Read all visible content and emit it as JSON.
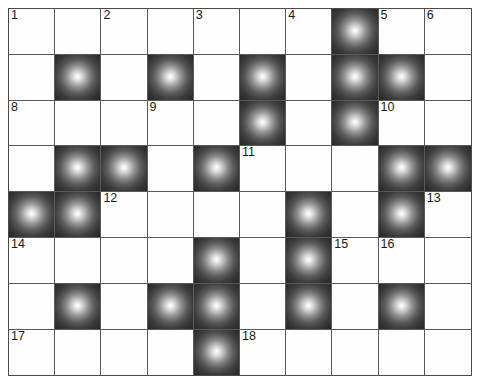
{
  "puzzle": {
    "type": "crossword-grid",
    "columns": 10,
    "rows": 7,
    "cell_size_px": 46,
    "grid_origin_px": [
      8,
      8
    ],
    "colors": {
      "empty_cell": "#fefefe",
      "block_cell_center": "#ffffff",
      "block_cell_edge": "#272727",
      "grid_line": "#5a5a5a",
      "border": "#4a4a4a",
      "number_text": "#1a1a1a"
    },
    "clue_numbers": [
      1,
      2,
      3,
      4,
      5,
      6,
      7,
      8,
      9,
      10,
      11,
      12,
      13,
      14,
      15,
      16,
      17,
      18
    ],
    "cells": [
      [
        {
          "block": false,
          "number": "1"
        },
        {
          "block": false,
          "number": ""
        },
        {
          "block": false,
          "number": "2"
        },
        {
          "block": false,
          "number": ""
        },
        {
          "block": false,
          "number": "3"
        },
        {
          "block": false,
          "number": ""
        },
        {
          "block": false,
          "number": "4"
        },
        {
          "block": true,
          "number": ""
        },
        {
          "block": false,
          "number": "5"
        },
        {
          "block": false,
          "number": "6"
        }
      ],
      [
        {
          "block": false,
          "number": ""
        },
        {
          "block": true,
          "number": ""
        },
        {
          "block": false,
          "number": ""
        },
        {
          "block": true,
          "number": ""
        },
        {
          "block": false,
          "number": ""
        },
        {
          "block": true,
          "number": ""
        },
        {
          "block": false,
          "number": ""
        },
        {
          "block": true,
          "number": ""
        },
        {
          "block": true,
          "number": ""
        },
        {
          "block": false,
          "number": ""
        }
      ],
      [
        {
          "block": false,
          "number": "8"
        },
        {
          "block": false,
          "number": ""
        },
        {
          "block": false,
          "number": ""
        },
        {
          "block": false,
          "number": "9"
        },
        {
          "block": false,
          "number": ""
        },
        {
          "block": true,
          "number": ""
        },
        {
          "block": false,
          "number": ""
        },
        {
          "block": true,
          "number": ""
        },
        {
          "block": false,
          "number": "10"
        },
        {
          "block": false,
          "number": ""
        }
      ],
      [
        {
          "block": false,
          "number": ""
        },
        {
          "block": true,
          "number": ""
        },
        {
          "block": true,
          "number": ""
        },
        {
          "block": false,
          "number": ""
        },
        {
          "block": true,
          "number": ""
        },
        {
          "block": false,
          "number": "11"
        },
        {
          "block": false,
          "number": ""
        },
        {
          "block": false,
          "number": ""
        },
        {
          "block": true,
          "number": ""
        },
        {
          "block": true,
          "number": ""
        }
      ],
      [
        {
          "block": true,
          "number": ""
        },
        {
          "block": true,
          "number": ""
        },
        {
          "block": false,
          "number": "12"
        },
        {
          "block": false,
          "number": ""
        },
        {
          "block": false,
          "number": ""
        },
        {
          "block": false,
          "number": ""
        },
        {
          "block": true,
          "number": ""
        },
        {
          "block": false,
          "number": ""
        },
        {
          "block": true,
          "number": ""
        },
        {
          "block": false,
          "number": "13"
        }
      ],
      [
        {
          "block": false,
          "number": "14"
        },
        {
          "block": false,
          "number": ""
        },
        {
          "block": false,
          "number": ""
        },
        {
          "block": false,
          "number": ""
        },
        {
          "block": true,
          "number": ""
        },
        {
          "block": false,
          "number": ""
        },
        {
          "block": true,
          "number": ""
        },
        {
          "block": false,
          "number": "15"
        },
        {
          "block": false,
          "number": "16"
        },
        {
          "block": false,
          "number": ""
        }
      ],
      [
        {
          "block": false,
          "number": ""
        },
        {
          "block": true,
          "number": ""
        },
        {
          "block": false,
          "number": ""
        },
        {
          "block": true,
          "number": ""
        },
        {
          "block": true,
          "number": ""
        },
        {
          "block": false,
          "number": ""
        },
        {
          "block": true,
          "number": ""
        },
        {
          "block": false,
          "number": ""
        },
        {
          "block": true,
          "number": ""
        },
        {
          "block": false,
          "number": ""
        }
      ],
      [
        {
          "block": false,
          "number": "17"
        },
        {
          "block": false,
          "number": ""
        },
        {
          "block": false,
          "number": ""
        },
        {
          "block": false,
          "number": ""
        },
        {
          "block": true,
          "number": ""
        },
        {
          "block": false,
          "number": "18"
        },
        {
          "block": false,
          "number": ""
        },
        {
          "block": false,
          "number": ""
        },
        {
          "block": false,
          "number": ""
        },
        {
          "block": false,
          "number": ""
        }
      ]
    ]
  }
}
